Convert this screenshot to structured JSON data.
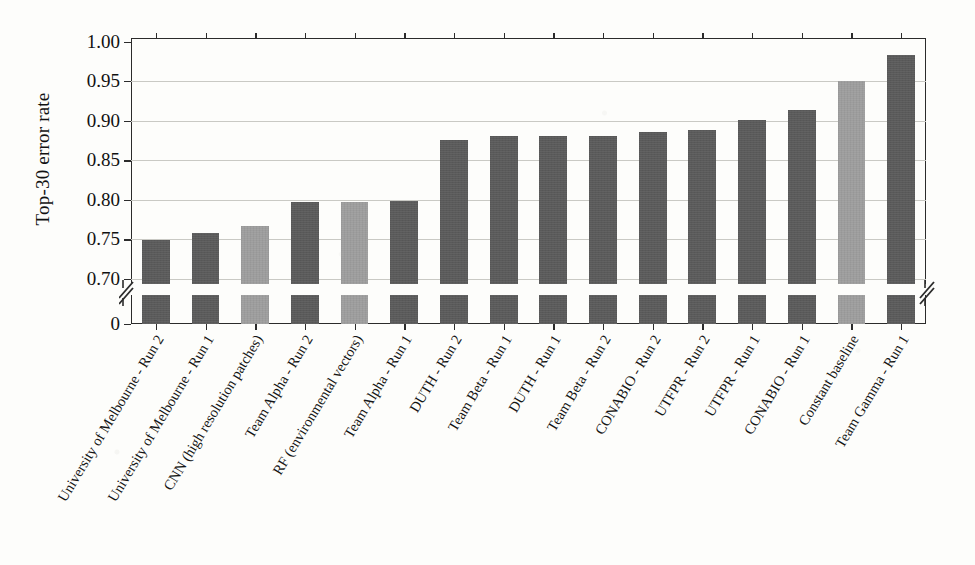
{
  "chart_data": {
    "type": "bar",
    "title": "",
    "subtitle": "",
    "xlabel": "",
    "ylabel": "Top-30 error rate",
    "ylim": [
      0.6935,
      1.0045
    ],
    "yticks": [
      "0.70",
      "0.75",
      "0.80",
      "0.85",
      "0.90",
      "0.95",
      "1.00"
    ],
    "ytick_values": [
      0.7,
      0.75,
      0.8,
      0.85,
      0.9,
      0.95,
      1.0
    ],
    "broken_axis": true,
    "break_note": "y-axis is broken between 0 and 0.70",
    "lower_axis_tick_label": "0",
    "grid": "horizontal",
    "legend": "none",
    "bar_colors": {
      "dark": "#5a5a5a",
      "light": "#9d9d9d"
    },
    "categories": [
      "University of Melbourne - Run 2",
      "University of Melbourne - Run 1",
      "CNN (high resolution patches)",
      "Team Alpha - Run 2",
      "RF (environmental vectors)",
      "Team Alpha - Run 1",
      "DUTH - Run 2",
      "Team Beta - Run 1",
      "DUTH - Run 1",
      "Team Beta - Run 2",
      "CONABIO - Run 2",
      "UTFPR - Run 2",
      "UTFPR - Run 1",
      "CONABIO - Run 1",
      "Constant baseline",
      "Team Gamma - Run 1"
    ],
    "values": [
      0.749,
      0.758,
      0.767,
      0.797,
      0.797,
      0.799,
      0.876,
      0.88,
      0.88,
      0.88,
      0.886,
      0.888,
      0.901,
      0.913,
      0.95,
      0.983
    ],
    "shades": [
      "dark",
      "dark",
      "light",
      "dark",
      "light",
      "dark",
      "dark",
      "dark",
      "dark",
      "dark",
      "dark",
      "dark",
      "dark",
      "dark",
      "light",
      "dark"
    ]
  }
}
